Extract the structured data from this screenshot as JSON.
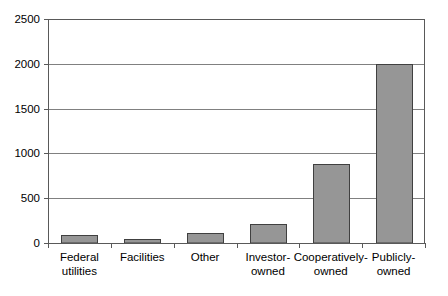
{
  "chart_data": {
    "type": "bar",
    "title": "",
    "subtitle": "",
    "xlabel": "",
    "ylabel": "",
    "categories": [
      "Federal utilities",
      "Facilities",
      "Other",
      "Investor-owned",
      "Cooperatively-owned",
      "Publicly-owned"
    ],
    "category_lines": [
      [
        "Federal",
        "utilities"
      ],
      [
        "Facilities",
        ""
      ],
      [
        "Other",
        ""
      ],
      [
        "Investor-",
        "owned"
      ],
      [
        "Cooperatively-",
        "owned"
      ],
      [
        "Publicly-",
        "owned"
      ]
    ],
    "values": [
      90,
      50,
      110,
      215,
      880,
      2000
    ],
    "ylim": [
      0,
      2500
    ],
    "ytick_labels": [
      "0",
      "500",
      "1000",
      "1500",
      "2000",
      "2500"
    ],
    "ytick_values": [
      0,
      500,
      1000,
      1500,
      2000,
      2500
    ],
    "grid": true,
    "grid_axis": "y",
    "legend": "none",
    "bar_fill_color": "#969696",
    "bar_stroke_color": "#404040",
    "grid_line_color": "#808080",
    "axis_line_color": "#595959",
    "plot_background": "#ffffff"
  }
}
